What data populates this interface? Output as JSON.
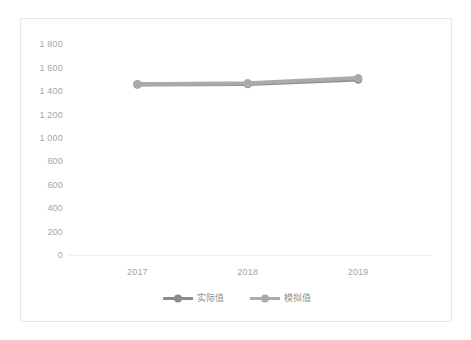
{
  "chart_data": {
    "type": "line",
    "title": "",
    "subtitle": "",
    "xlabel": "",
    "ylabel": "",
    "categories": [
      "2017",
      "2018",
      "2019"
    ],
    "x_tick_labels": [
      "2017",
      "2018",
      "2019"
    ],
    "y_tick_labels": [
      "1 800",
      "1 600",
      "1 400",
      "1 200",
      "1 000",
      "800",
      "600",
      "400",
      "200",
      "0"
    ],
    "y_tick_values": [
      1800,
      1600,
      1400,
      1200,
      1000,
      800,
      600,
      400,
      200,
      0
    ],
    "ylim": [
      0,
      1800
    ],
    "grid": false,
    "legend_position": "bottom-center",
    "series": [
      {
        "name": "实际值",
        "color": "#8c8c8c",
        "marker": "circle",
        "values": [
          1458,
          1462,
          1500
        ]
      },
      {
        "name": "模拟值",
        "color": "#aaaaaa",
        "marker": "circle",
        "values": [
          1460,
          1468,
          1512
        ]
      }
    ]
  },
  "figure": {
    "border_color": "#e8e8e8",
    "background": "#ffffff",
    "axis_line_color": "#ededed",
    "tick_label_color": "#a6a6a6"
  },
  "legend": {
    "entries": [
      {
        "label": "实际值",
        "color": "#8c8c8c"
      },
      {
        "label": "模拟值",
        "color": "#aaaaaa"
      }
    ]
  }
}
